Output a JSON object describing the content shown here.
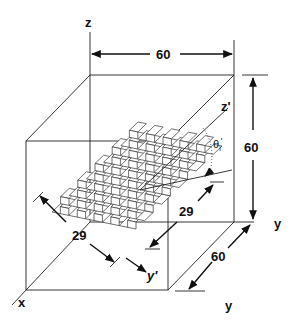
{
  "diagram": {
    "axes": {
      "z": "z",
      "z_prime": "z'",
      "x": "x",
      "y_right": "y",
      "y_bottom": "y",
      "y_prime": "y'"
    },
    "dimensions": {
      "top_width": "60",
      "height": "60",
      "depth": "60",
      "surface_length": "29",
      "surface_width": "29"
    },
    "angle_label": "θi'",
    "angle_symbol": "θ",
    "angle_sub": "i",
    "angle_prime": "'",
    "colors": {
      "line": "#111111",
      "background": "#ffffff"
    }
  }
}
